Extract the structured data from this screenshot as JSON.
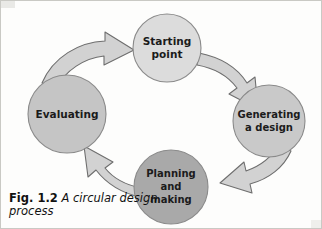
{
  "figure": {
    "caption_number": "Fig. 1.2",
    "caption_text": "A circular design process",
    "background_color": "#fdfdfc",
    "border_color": "#c9c9c4"
  },
  "diagram": {
    "type": "cycle",
    "direction": "clockwise",
    "arrow_fill": "#d2d2d2",
    "arrow_stroke": "#6e6e6e",
    "node_stroke": "#8a8a8a",
    "nodes": [
      {
        "id": "starting-point",
        "lines": [
          "Starting",
          "point"
        ],
        "cx": 166,
        "cy": 47,
        "r": 34,
        "fill": "#dcdcdc",
        "font_size": 10.5
      },
      {
        "id": "generating-a-design",
        "lines": [
          "Generating",
          "a design"
        ],
        "cx": 268,
        "cy": 120,
        "r": 36,
        "fill": "#c9c9c9",
        "font_size": 10
      },
      {
        "id": "planning-and-making",
        "lines": [
          "Planning",
          "and",
          "making"
        ],
        "cx": 170,
        "cy": 186,
        "r": 37,
        "fill": "#a9a9a9",
        "font_size": 10
      },
      {
        "id": "evaluating",
        "lines": [
          "Evaluating"
        ],
        "cx": 66,
        "cy": 113,
        "r": 39,
        "fill": "#c5c5c5",
        "font_size": 10.5
      }
    ],
    "arrows": [
      {
        "id": "arrow-evaluating-to-starting",
        "from": "evaluating",
        "to": "starting-point"
      },
      {
        "id": "arrow-starting-to-generating",
        "from": "starting-point",
        "to": "generating-a-design"
      },
      {
        "id": "arrow-generating-to-planning",
        "from": "generating-a-design",
        "to": "planning-and-making"
      },
      {
        "id": "arrow-planning-to-evaluating",
        "from": "planning-and-making",
        "to": "evaluating"
      }
    ]
  }
}
